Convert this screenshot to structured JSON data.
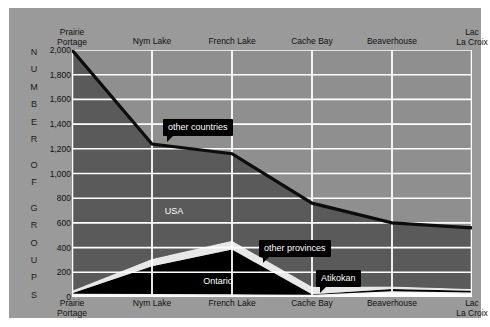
{
  "figure": {
    "panel_bg": "#9a9a9a",
    "plot_bg": "#8f8f8f",
    "gridline_color": "#ffffff",
    "callout_bg": "#000000"
  },
  "axis": {
    "y_title_letters": [
      "N",
      "U",
      "M",
      "B",
      "E",
      "R",
      "",
      "O",
      "F",
      "",
      "G",
      "R",
      "O",
      "U",
      "P",
      "S"
    ],
    "y_title_text": "NUMBER OF GROUPS",
    "y_ticks": [
      "2,000",
      "1,800",
      "1,600",
      "1,400",
      "1,200",
      "1,000",
      "800",
      "600",
      "400",
      "200",
      "0"
    ],
    "y_tick_values": [
      2000,
      1800,
      1600,
      1400,
      1200,
      1000,
      800,
      600,
      400,
      200,
      0
    ],
    "x_labels": [
      "Prairie\nPortage",
      "Nym Lake",
      "French Lake",
      "Cache Bay",
      "Beaverhouse",
      "Lac\nLa Croix"
    ]
  },
  "labels": {
    "inline": [
      {
        "text": "USA",
        "x_frac": 0.255,
        "y_value": 700
      },
      {
        "text": "Ontario",
        "x_frac": 0.365,
        "y_value": 130
      }
    ],
    "callouts": [
      {
        "text": "other countries",
        "x": 154,
        "y": 111,
        "tail": "down-left"
      },
      {
        "text": "other provinces",
        "x": 250,
        "y": 232,
        "tail": "down-left"
      },
      {
        "text": "Atikokan",
        "x": 307,
        "y": 262,
        "tail": "down-left"
      }
    ]
  },
  "chart_data": {
    "type": "area",
    "title": "",
    "xlabel": "",
    "ylabel": "NUMBER OF GROUPS",
    "ylim": [
      0,
      2000
    ],
    "ytick_step": 200,
    "grid": true,
    "stacked": true,
    "legend": "inline labels and callouts",
    "categories": [
      "Prairie Portage",
      "Nym Lake",
      "French Lake",
      "Cache Bay",
      "Beaverhouse",
      "Lac La Croix"
    ],
    "series": [
      {
        "name": "Atikokan",
        "color": "#ffffff",
        "values": [
          20,
          18,
          15,
          12,
          40,
          30
        ]
      },
      {
        "name": "Ontario",
        "color": "#000000",
        "values": [
          10,
          230,
          370,
          10,
          25,
          20
        ]
      },
      {
        "name": "other provinces",
        "color": "#e8e8e8",
        "values": [
          20,
          60,
          70,
          60,
          20,
          15
        ]
      },
      {
        "name": "USA",
        "color": "#5a5a5a",
        "values": [
          1950,
          930,
          705,
          678,
          515,
          495
        ]
      }
    ],
    "totals": [
      2000,
      1238,
      1160,
      760,
      600,
      560
    ]
  }
}
